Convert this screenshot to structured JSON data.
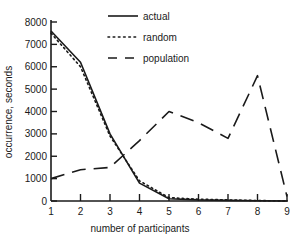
{
  "chart_data": {
    "type": "line",
    "title": "",
    "xlabel": "number of participants",
    "ylabel": "occurrence, seconds",
    "x": [
      1,
      2,
      3,
      4,
      5,
      6,
      7,
      8,
      9
    ],
    "xlim": [
      1,
      9
    ],
    "ylim": [
      0,
      8000
    ],
    "xticks": [
      "1",
      "2",
      "3",
      "4",
      "5",
      "6",
      "7",
      "8",
      "9"
    ],
    "yticks": [
      "0",
      "1000",
      "2000",
      "3000",
      "4000",
      "5000",
      "6000",
      "7000",
      "8000"
    ],
    "grid": false,
    "legend_position": "top-center",
    "series": [
      {
        "name": "actual",
        "style": "solid",
        "values": [
          7600,
          6200,
          3000,
          800,
          100,
          50,
          30,
          10,
          0
        ]
      },
      {
        "name": "random",
        "style": "dotted",
        "values": [
          7500,
          6000,
          2900,
          900,
          150,
          80,
          50,
          20,
          0
        ]
      },
      {
        "name": "population",
        "style": "dashed",
        "values": [
          1000,
          1400,
          1500,
          2700,
          4000,
          3500,
          2800,
          5600,
          200
        ]
      }
    ]
  }
}
